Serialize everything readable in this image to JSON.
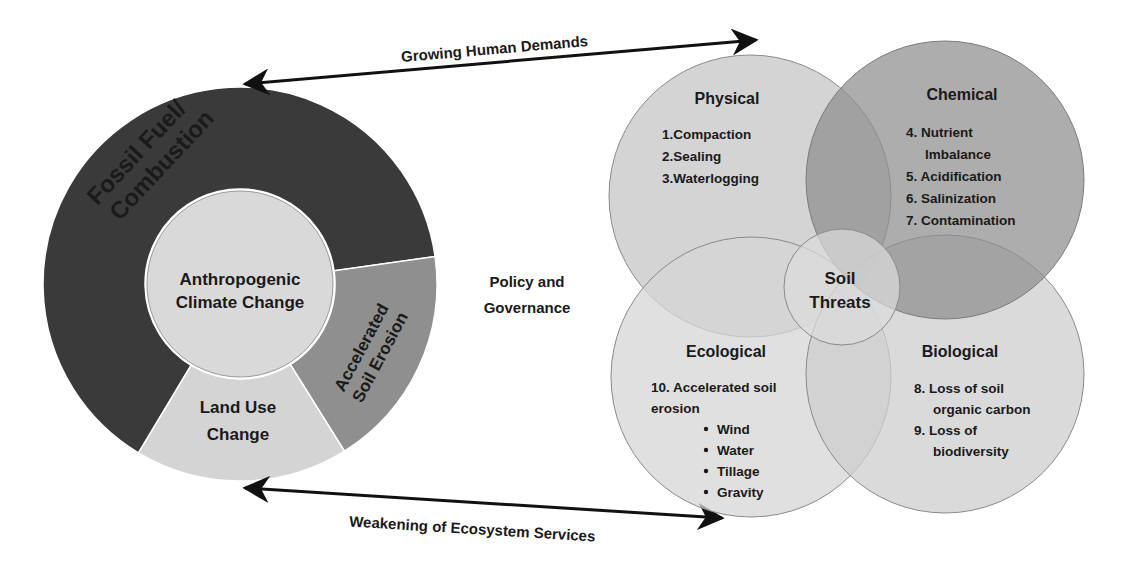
{
  "colors": {
    "background": "#ffffff",
    "fossil_fuel": "#3a3a3a",
    "accelerated_erosion": "#8f8f8f",
    "land_use": "#d4d4d4",
    "center_circle": "#d9d9d9",
    "physical": "#d2d2d2",
    "chemical": "#8e8e8e",
    "ecological": "#d6d6d6",
    "biological": "#cdcdcd",
    "soil_threats": "#dcdcdc",
    "text": "#1a1a1a",
    "arrow": "#111111"
  },
  "arrows": {
    "top": {
      "label": "Growing Human Demands"
    },
    "bottom": {
      "label": "Weakening of Ecosystem Services"
    }
  },
  "donut": {
    "center_label_line1": "Anthropogenic",
    "center_label_line2": "Climate Change",
    "segments": [
      {
        "id": "fossil-fuel",
        "line1": "Fossil Fuel/",
        "line2": "Combustion"
      },
      {
        "id": "accelerated-soil-erosion",
        "line1": "Accelerated",
        "line2": "Soil Erosion"
      },
      {
        "id": "land-use-change",
        "line1": "Land Use",
        "line2": "Change"
      }
    ]
  },
  "middle": {
    "line1": "Policy and",
    "line2": "Governance"
  },
  "venn": {
    "center": {
      "line1": "Soil",
      "line2": "Threats"
    },
    "physical": {
      "title": "Physical",
      "items": [
        "1.Compaction",
        "2.Sealing",
        "3.Waterlogging"
      ]
    },
    "chemical": {
      "title": "Chemical",
      "items": [
        "4. Nutrient",
        "Imbalance",
        "5. Acidification",
        "6. Salinization",
        "7. Contamination"
      ]
    },
    "ecological": {
      "title": "Ecological",
      "items": [
        "10. Accelerated soil",
        "erosion"
      ],
      "bullets": [
        "Wind",
        "Water",
        "Tillage",
        "Gravity"
      ]
    },
    "biological": {
      "title": "Biological",
      "items": [
        "8. Loss of soil",
        "organic carbon",
        "9. Loss of",
        "biodiversity"
      ]
    }
  }
}
